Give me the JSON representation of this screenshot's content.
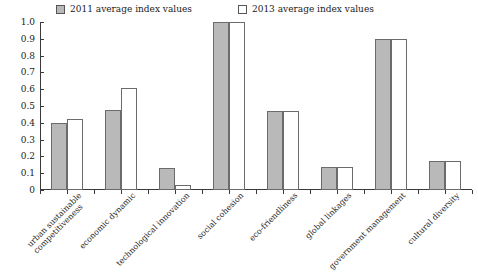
{
  "chart_data": {
    "type": "bar",
    "title": "",
    "xlabel": "",
    "ylabel": "",
    "ylim": [
      0,
      1.0
    ],
    "ytick_labels": [
      "1.0",
      "0.9",
      "0.8",
      "0.7",
      "0.6",
      "0.5",
      "0.4",
      "0.3",
      "0.2",
      "0.1",
      "0"
    ],
    "ytick_values": [
      1.0,
      0.9,
      0.8,
      0.7,
      0.6,
      0.5,
      0.4,
      0.3,
      0.2,
      0.1,
      0.0
    ],
    "grid": false,
    "legend_position": "top-left",
    "categories": [
      "urban sustainable competitiveness",
      "economic dynamic",
      "technological innovation",
      "social cohesion",
      "eco-friendliness",
      "global linkages",
      "government management",
      "cultural diversity"
    ],
    "category_lines": [
      [
        "urban sustainable",
        "competitiveness"
      ],
      [
        "economic dynamic",
        ""
      ],
      [
        "technological innovation",
        ""
      ],
      [
        "social cohesion",
        ""
      ],
      [
        "eco-friendliness",
        ""
      ],
      [
        "global linkages",
        ""
      ],
      [
        "government management",
        ""
      ],
      [
        "cultural diversity",
        ""
      ]
    ],
    "series": [
      {
        "name": "2011 average index values",
        "color": "#b9b9b9",
        "values": [
          0.4,
          0.475,
          0.13,
          1.0,
          0.47,
          0.135,
          0.9,
          0.17
        ]
      },
      {
        "name": "2013 average index values",
        "color": "#ffffff",
        "values": [
          0.42,
          0.61,
          0.03,
          1.0,
          0.47,
          0.135,
          0.9,
          0.17
        ]
      }
    ]
  },
  "legend": {
    "entries": [
      {
        "label": "2011 average index values",
        "swatch": "filled"
      },
      {
        "label": "2013 average index values",
        "swatch": "hollow"
      }
    ]
  }
}
